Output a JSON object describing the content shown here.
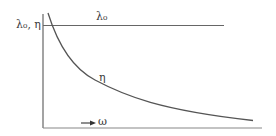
{
  "diagram": {
    "type": "qualitative-curve",
    "y_axis_label": "λ₀, η",
    "x_axis_label": "→ ω",
    "x_axis_arrow": "→",
    "x_axis_symbol": "ω",
    "series": [
      {
        "name": "λ₀",
        "label": "λ₀",
        "shape": "constant",
        "description": "horizontal line"
      },
      {
        "name": "η",
        "label": "η",
        "shape": "decreasing",
        "description": "monotonically decreasing curve approaching an asymptote"
      }
    ],
    "colors": {
      "line": "#555555",
      "text": "#3a3a3a",
      "background": "#ffffff"
    }
  }
}
